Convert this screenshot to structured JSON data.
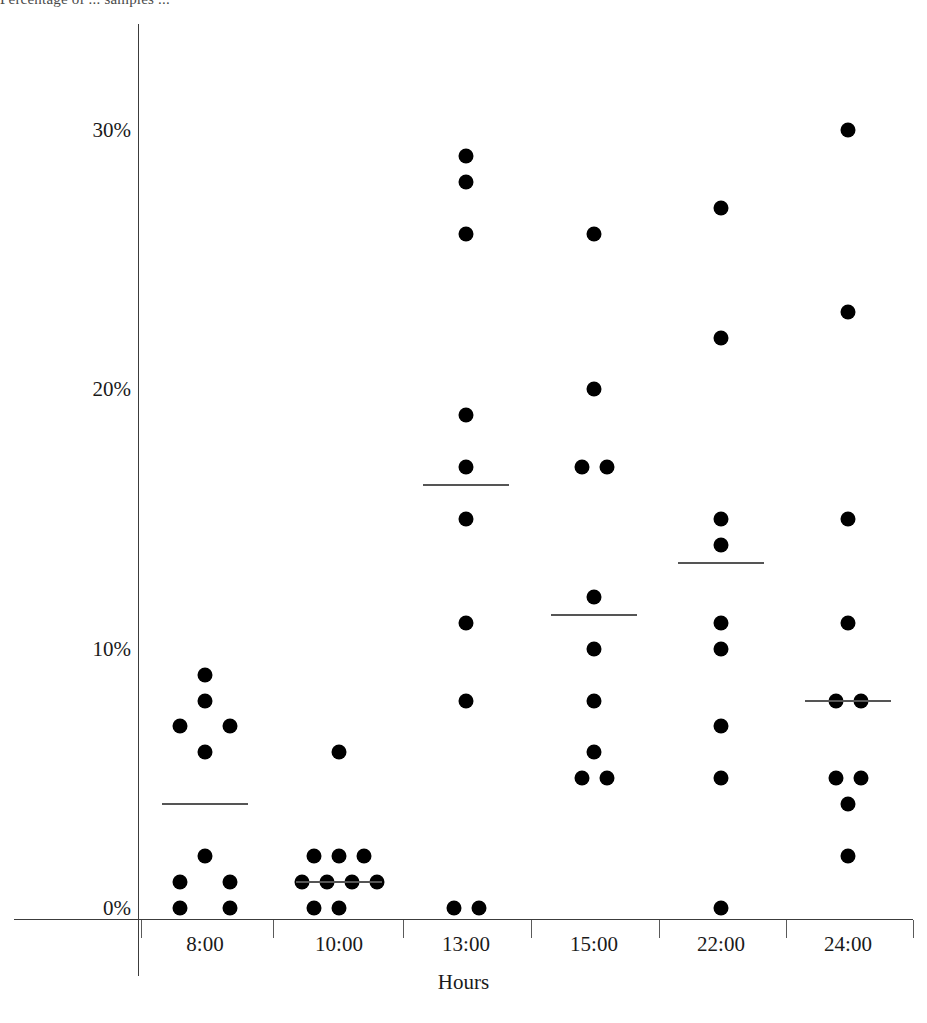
{
  "caption_fragment": "Percentage of ... samples ...",
  "chart_data": {
    "type": "scatter",
    "title": "",
    "xlabel": "Hours",
    "ylabel": "",
    "categories": [
      "8:00",
      "10:00",
      "13:00",
      "15:00",
      "22:00",
      "24:00"
    ],
    "ytick_labels": [
      "0%",
      "10%",
      "20%",
      "30%"
    ],
    "ytick_values": [
      0,
      10,
      20,
      30
    ],
    "ylim": [
      0,
      35
    ],
    "grid": false,
    "legend": null,
    "marker": "filled-circle",
    "marker_color": "#000000",
    "mean_marker": "horizontal-line",
    "mean_color": "#555555",
    "groups": [
      {
        "category": "8:00",
        "mean": 4.0,
        "values": [
          9,
          8,
          7,
          7,
          6,
          2,
          1,
          1,
          0,
          0
        ]
      },
      {
        "category": "10:00",
        "mean": 1.0,
        "values": [
          6,
          2,
          2,
          2,
          1,
          1,
          1,
          1,
          0,
          0
        ]
      },
      {
        "category": "13:00",
        "mean": 16.3,
        "values": [
          29,
          28,
          26,
          19,
          17,
          15,
          11,
          8,
          0,
          0
        ]
      },
      {
        "category": "15:00",
        "mean": 11.3,
        "values": [
          26,
          20,
          17,
          17,
          12,
          10,
          8,
          6,
          5,
          5
        ]
      },
      {
        "category": "22:00",
        "mean": 13.3,
        "values": [
          27,
          22,
          15,
          14,
          11,
          10,
          7,
          5,
          0
        ]
      },
      {
        "category": "24:00",
        "mean": 8.0,
        "values": [
          30,
          23,
          15,
          11,
          8,
          8,
          5,
          5,
          4,
          2
        ]
      }
    ],
    "point_layout": {
      "8:00": [
        [
          0,
          9
        ],
        [
          0,
          8
        ],
        [
          -1,
          7
        ],
        [
          1,
          7
        ],
        [
          0,
          6
        ],
        [
          0,
          2
        ],
        [
          -1,
          1
        ],
        [
          1,
          1
        ],
        [
          -1,
          0
        ],
        [
          1,
          0
        ]
      ],
      "10:00": [
        [
          0,
          6
        ],
        [
          -1,
          2
        ],
        [
          0,
          2
        ],
        [
          1,
          2
        ],
        [
          -1.5,
          1
        ],
        [
          -0.5,
          1
        ],
        [
          0.5,
          1
        ],
        [
          1.5,
          1
        ],
        [
          -1,
          0
        ],
        [
          0,
          0
        ]
      ],
      "13:00": [
        [
          0,
          29
        ],
        [
          0,
          28
        ],
        [
          0,
          26
        ],
        [
          0,
          19
        ],
        [
          0,
          17
        ],
        [
          0,
          15
        ],
        [
          0,
          11
        ],
        [
          0,
          8
        ],
        [
          -0.5,
          0
        ],
        [
          0.5,
          0
        ]
      ],
      "15:00": [
        [
          0,
          26
        ],
        [
          0,
          20
        ],
        [
          -0.5,
          17
        ],
        [
          0.5,
          17
        ],
        [
          0,
          12
        ],
        [
          0,
          10
        ],
        [
          0,
          8
        ],
        [
          0,
          6
        ],
        [
          -0.5,
          5
        ],
        [
          0.5,
          5
        ]
      ],
      "22:00": [
        [
          0,
          27
        ],
        [
          0,
          22
        ],
        [
          0,
          15
        ],
        [
          0,
          14
        ],
        [
          0,
          11
        ],
        [
          0,
          10
        ],
        [
          0,
          7
        ],
        [
          0,
          5
        ],
        [
          0,
          0
        ]
      ],
      "24:00": [
        [
          0,
          30
        ],
        [
          0,
          23
        ],
        [
          0,
          15
        ],
        [
          0,
          11
        ],
        [
          -0.5,
          8
        ],
        [
          0.5,
          8
        ],
        [
          -0.5,
          5
        ],
        [
          0.5,
          5
        ],
        [
          0,
          4
        ],
        [
          0,
          2
        ]
      ]
    }
  }
}
